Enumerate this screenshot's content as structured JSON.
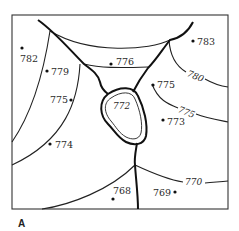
{
  "figure": {
    "panel_label": "A",
    "lake": {
      "elevation": "772"
    },
    "contours": [
      {
        "id": "c780",
        "label": "780"
      },
      {
        "id": "c775",
        "label": "775"
      },
      {
        "id": "c770",
        "label": "770"
      }
    ],
    "spot_elevations": [
      {
        "id": "p782",
        "label": "782"
      },
      {
        "id": "p779",
        "label": "779"
      },
      {
        "id": "p776",
        "label": "776"
      },
      {
        "id": "p783",
        "label": "783"
      },
      {
        "id": "p775a",
        "label": "775"
      },
      {
        "id": "p775b",
        "label": "775"
      },
      {
        "id": "p773",
        "label": "773"
      },
      {
        "id": "p774",
        "label": "774"
      },
      {
        "id": "p768",
        "label": "768"
      },
      {
        "id": "p769",
        "label": "769"
      }
    ],
    "colors": {
      "ink": "#222222",
      "background": "#ffffff"
    }
  }
}
